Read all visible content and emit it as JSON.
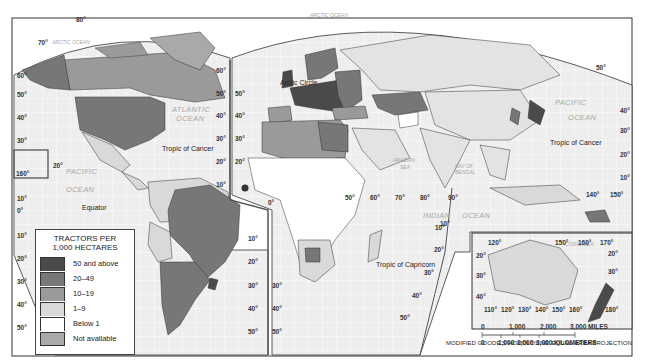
{
  "title_legend": "TRACTORS PER 1,000 HECTARES",
  "legend": {
    "title_line1": "TRACTORS PER",
    "title_line2": "1,000 HECTARES",
    "items": [
      {
        "label": "50 and above",
        "color": "#4a4a4a"
      },
      {
        "label": "20–49",
        "color": "#777777"
      },
      {
        "label": "10–19",
        "color": "#9a9a9a"
      },
      {
        "label": "1–9",
        "color": "#d9d9d9"
      },
      {
        "label": "Below 1",
        "color": "#ffffff"
      },
      {
        "label": "Not available",
        "color": "#a9a9a9"
      }
    ]
  },
  "colors": {
    "ocean": "#eeeeee",
    "grid": "#ffffff",
    "outline": "#333333",
    "land_nodata": "#e3e3e3"
  },
  "labels": {
    "arctic_ocean_west": "ARCTIC OCEAN",
    "arctic_ocean_east": "ARCTIC OCEAN",
    "atlantic_ocean_1": "ATLANTIC",
    "atlantic_ocean_2": "OCEAN",
    "pacific_west_1": "PACIFIC",
    "pacific_west_2": "OCEAN",
    "pacific_east_1": "PACIFIC",
    "pacific_east_2": "OCEAN",
    "indian_1": "INDIAN",
    "indian_2": "OCEAN",
    "arabian_1": "ARABIAN",
    "arabian_2": "SEA",
    "bengal_1": "BAY OF",
    "bengal_2": "BENGAL",
    "coral_sea": "CORAL SEA",
    "arctic_circle": "Arctic Circle",
    "tropic_cancer_west": "Tropic of Cancer",
    "tropic_cancer_east": "Tropic of Cancer",
    "tropic_capricorn": "Tropic of Capricorn",
    "equator": "Equator"
  },
  "latitudes": {
    "west_edge": [
      "60°",
      "50°",
      "40°",
      "30°",
      "10°",
      "0°",
      "10°",
      "20°",
      "30°",
      "40°",
      "50°"
    ],
    "mid_left": [
      "60°",
      "50°",
      "40°",
      "30°",
      "20°",
      "10°",
      "10°",
      "20°",
      "30°",
      "40°",
      "50°"
    ],
    "mid_right": [
      "50°",
      "40°",
      "30°",
      "20°",
      "30°",
      "40°",
      "50°"
    ],
    "east_edge": [
      "40°",
      "30°",
      "20°",
      "10°"
    ],
    "alaska": [
      "80°",
      "70°"
    ],
    "hawaii": [
      "20°",
      "160°"
    ],
    "africa_east": [
      "10°",
      "20°",
      "30°",
      "40°",
      "50°"
    ],
    "zero_meridian": "0°",
    "indian_longitudes": [
      "50°",
      "60°",
      "70°",
      "80°",
      "90°"
    ],
    "indian_10": "10°",
    "asia_longitudes": [
      "140°",
      "150°"
    ],
    "pacific_50": "50°"
  },
  "inset": {
    "top_longitudes": [
      "120°",
      "150°",
      "160°",
      "170°"
    ],
    "bottom_longitudes": [
      "110°",
      "120°",
      "130°",
      "140°",
      "150°",
      "160°",
      "180°"
    ],
    "left_latitudes": [
      "20°",
      "30°",
      "40°"
    ],
    "right_latitudes": [
      "20°",
      "30°"
    ]
  },
  "scale": {
    "miles": [
      "0",
      "1,000",
      "2,000",
      "3,000 MILES"
    ],
    "kilometers": [
      "0",
      "1,000",
      "2,000",
      "3,000 KILOMETERS"
    ]
  },
  "projection": "MODIFIED GOODE'S HOMOLOSINE EQUAL-AREA PROJECTION"
}
